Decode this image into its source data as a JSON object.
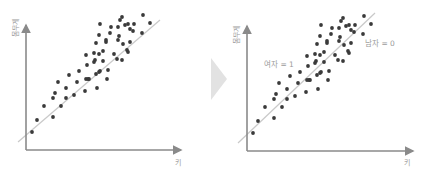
{
  "chart_data": [
    {
      "type": "scatter",
      "title": "",
      "xlabel": "키",
      "ylabel": "몸무게",
      "grid": false,
      "legend": null,
      "regression_line": {
        "from": [
          18,
          142
        ],
        "to": [
          160,
          20
        ]
      },
      "points_px": [
        [
          32,
          132
        ],
        [
          37,
          120
        ],
        [
          44,
          106
        ],
        [
          53,
          117
        ],
        [
          53,
          98
        ],
        [
          55,
          93
        ],
        [
          58,
          82
        ],
        [
          61,
          106
        ],
        [
          66,
          98
        ],
        [
          66,
          88
        ],
        [
          69,
          75
        ],
        [
          74,
          95
        ],
        [
          77,
          82
        ],
        [
          79,
          71
        ],
        [
          85,
          91
        ],
        [
          86,
          79
        ],
        [
          86,
          55
        ],
        [
          87,
          65
        ],
        [
          88,
          79
        ],
        [
          89,
          79
        ],
        [
          94,
          62
        ],
        [
          94,
          53
        ],
        [
          95,
          60
        ],
        [
          96,
          74
        ],
        [
          97,
          88
        ],
        [
          99,
          72
        ],
        [
          100,
          71
        ],
        [
          96,
          43
        ],
        [
          99,
          35
        ],
        [
          100,
          24
        ],
        [
          99,
          54
        ],
        [
          103,
          51
        ],
        [
          103,
          61
        ],
        [
          106,
          42
        ],
        [
          106,
          40
        ],
        [
          107,
          79
        ],
        [
          108,
          70
        ],
        [
          110,
          33
        ],
        [
          111,
          27
        ],
        [
          114,
          54
        ],
        [
          117,
          59
        ],
        [
          118,
          40
        ],
        [
          118,
          27
        ],
        [
          120,
          20
        ],
        [
          119,
          36
        ],
        [
          122,
          17
        ],
        [
          122,
          60
        ],
        [
          123,
          44
        ],
        [
          125,
          25
        ],
        [
          127,
          50
        ],
        [
          128,
          52
        ],
        [
          130,
          42
        ],
        [
          130,
          29
        ],
        [
          133,
          31
        ],
        [
          134,
          24
        ],
        [
          128,
          24
        ],
        [
          142,
          33
        ],
        [
          143,
          15
        ],
        [
          150,
          23
        ]
      ]
    },
    {
      "type": "scatter",
      "title": "",
      "xlabel": "키",
      "ylabel": "몸무게",
      "grid": false,
      "legend": null,
      "annotations": [
        "여자 = 1",
        "남자 = 0"
      ],
      "regression_line": {
        "from": [
          238,
          143
        ],
        "to": [
          375,
          13
        ]
      },
      "offset_x": 221
    }
  ],
  "left": {
    "ylabel": "몸무게",
    "xlabel": "키"
  },
  "right": {
    "ylabel": "몸무게",
    "xlabel": "키",
    "female_label": "여자 = 1",
    "male_label": "남자 = 0"
  },
  "arrow": {
    "color": "#e2e2e2"
  }
}
